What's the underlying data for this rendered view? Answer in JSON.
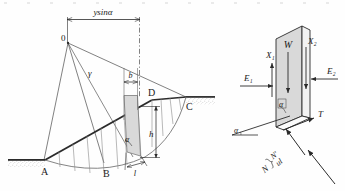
{
  "figure": {
    "stroke_color": "#2b2b2b",
    "fill_color": "#d9d9d9",
    "ground_color": "#8c8c8c"
  },
  "left_diagram": {
    "name": "slope-slice-diagram",
    "dimension_label": "ysinα",
    "center_point_label": "0",
    "radius_label": "γ",
    "points": {
      "a": "A",
      "b": "B",
      "c": "C",
      "d": "D"
    },
    "slice_labels": {
      "width": "b",
      "height": "h",
      "base_length": "l",
      "base_angle": "α"
    }
  },
  "right_diagram": {
    "name": "slice-free-body-diagram",
    "forces": {
      "weight": "W",
      "x1": "X₁",
      "x2": "X₂",
      "e1": "E₁",
      "e2": "E₂",
      "shear": "T",
      "normal": "N",
      "effective_normal": "N'",
      "pore_force": "ul"
    },
    "angles": {
      "base_angle_top": "α",
      "base_angle_bottom": "α"
    }
  }
}
